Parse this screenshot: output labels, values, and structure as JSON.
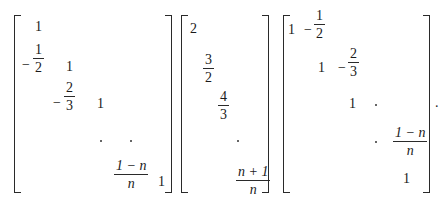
{
  "equation": {
    "matrix_1": {
      "description": "lower bidiagonal",
      "diagonal": [
        "1",
        "1",
        "1",
        "1"
      ],
      "subdiagonal": [
        "-1/2",
        "-2/3",
        "(1-n)/n"
      ],
      "entries": {
        "r1c1": "1",
        "r2c1_sign": "−",
        "r2c1_num": "1",
        "r2c1_den": "2",
        "r2c2": "1",
        "r3c2_sign": "−",
        "r3c2_num": "2",
        "r3c2_den": "3",
        "r3c3": "1",
        "rnc_prev_num": "1 − n",
        "rnc_prev_den": "n",
        "rncn": "1"
      }
    },
    "matrix_2": {
      "description": "diagonal",
      "diagonal": [
        "2",
        "3/2",
        "4/3",
        "(n+1)/n"
      ],
      "entries": {
        "d1": "2",
        "d2_num": "3",
        "d2_den": "2",
        "d3_num": "4",
        "d3_den": "3",
        "dn_num": "n + 1",
        "dn_den": "n"
      }
    },
    "matrix_3": {
      "description": "upper bidiagonal",
      "diagonal": [
        "1",
        "1",
        "1",
        "1"
      ],
      "superdiagonal": [
        "-1/2",
        "-2/3",
        "(1-n)/n"
      ],
      "entries": {
        "r1c1": "1",
        "r1c2_sign": "−",
        "r1c2_num": "1",
        "r1c2_den": "2",
        "r2c2": "1",
        "r2c3_sign": "−",
        "r2c3_num": "2",
        "r2c3_den": "3",
        "r3c3": "1",
        "rprev_cn_num": "1 − n",
        "rprev_cn_den": "n",
        "rncn": "1"
      }
    },
    "terminal_punctuation": "."
  }
}
